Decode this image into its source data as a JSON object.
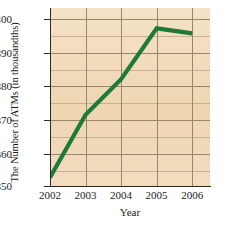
{
  "chart_data": {
    "type": "line",
    "title": "",
    "xlabel": "Year",
    "ylabel": "The Number of ATMs (in thousandths)",
    "categories": [
      "2002",
      "2003",
      "2004",
      "2005",
      "2006"
    ],
    "x": [
      2002,
      2003,
      2004,
      2005,
      2006
    ],
    "values": [
      352.5,
      371.0,
      381.5,
      396.5,
      395.0
    ],
    "series": [
      {
        "name": "The Number of ATMs",
        "values": [
          352.5,
          371.0,
          381.5,
          396.5,
          395.0
        ],
        "color": "#1d7a3a"
      }
    ],
    "xlim": [
      2002,
      2006.5
    ],
    "ylim": [
      350,
      402.5
    ],
    "ytick_labels": [
      "350",
      "360",
      "370",
      "380",
      "390",
      "400"
    ],
    "ytick_values": [
      350,
      360,
      370,
      380,
      390,
      400
    ],
    "xtick_labels": [
      "2002",
      "2003",
      "2004",
      "2005",
      "2006"
    ],
    "minor_ytick_values": [
      355,
      365,
      375,
      385,
      395
    ],
    "grid": true,
    "grid_color": "#9c8468",
    "legend": false,
    "legend_position": "none",
    "plot_background": "#f2dcbd",
    "line_width": 4
  }
}
